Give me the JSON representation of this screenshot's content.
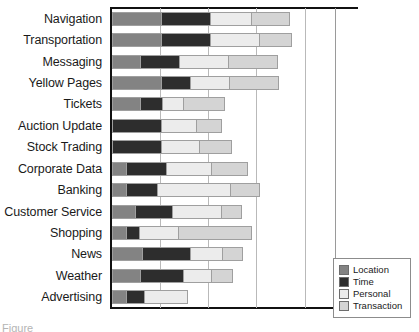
{
  "chart_data": {
    "type": "bar",
    "orientation": "horizontal",
    "stacked": true,
    "title": "",
    "xlabel": "",
    "ylabel": "",
    "grid": true,
    "xlim": [
      0,
      226
    ],
    "gridlines": [
      48,
      96,
      144,
      193
    ],
    "legend_position": "bottom-right",
    "categories": [
      "Navigation",
      "Transportation",
      "Messaging",
      "Yellow Pages",
      "Tickets",
      "Auction Update",
      "Stock Trading",
      "Corporate Data",
      "Banking",
      "Customer Service",
      "Shopping",
      "News",
      "Weather",
      "Advertising"
    ],
    "series": [
      {
        "name": "Location",
        "color": "#838383",
        "values": [
          48,
          48,
          27,
          48,
          27,
          0,
          0,
          13,
          13,
          22,
          13,
          29,
          27,
          13
        ]
      },
      {
        "name": "Time",
        "color": "#2d2d2d",
        "values": [
          48,
          48,
          38,
          28,
          21,
          48,
          48,
          39,
          30,
          36,
          12,
          47,
          42,
          17
        ]
      },
      {
        "name": "Personal",
        "color": "#ececec",
        "values": [
          40,
          48,
          48,
          38,
          20,
          34,
          37,
          44,
          72,
          48,
          38,
          31,
          27,
          42
        ]
      },
      {
        "name": "Transaction",
        "color": "#d4d4d4",
        "values": [
          37,
          31,
          48,
          48,
          40,
          24,
          31,
          35,
          28,
          19,
          72,
          19,
          20,
          0
        ]
      }
    ]
  },
  "legend": {
    "items": [
      {
        "label": "Location",
        "color": "#838383"
      },
      {
        "label": "Time",
        "color": "#2d2d2d"
      },
      {
        "label": "Personal",
        "color": "#ececec"
      },
      {
        "label": "Transaction",
        "color": "#d4d4d4"
      }
    ]
  },
  "caption": {
    "text": "Figure"
  }
}
